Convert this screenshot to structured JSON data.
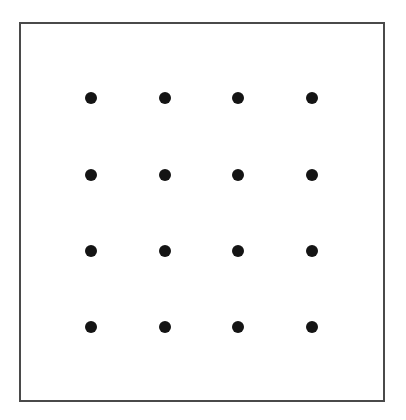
{
  "figure": {
    "title": "",
    "caption": "",
    "background_color": "#ffffff",
    "width": 406,
    "height": 420
  },
  "frame": {
    "name": "outer-border-rectangle",
    "x": 19,
    "y": 22,
    "width": 366,
    "height": 380,
    "border_width": 2,
    "border_color": "#4a4a4a",
    "fill_color": "#ffffff"
  },
  "chart_data": {
    "type": "scatter",
    "title": "",
    "subtitle": "",
    "xlabel": "",
    "ylabel": "",
    "grid": false,
    "legend": null,
    "legend_position": "none",
    "annotations": [],
    "xlim": [
      19,
      385
    ],
    "ylim": [
      22,
      402
    ],
    "xtick_labels": [],
    "ytick_labels": [],
    "marker": {
      "shape": "circle",
      "filled": true,
      "color": "#141414",
      "diameter_px": 12
    },
    "rows": 4,
    "columns": 4,
    "point_count": 16,
    "column_centers_x": [
      91,
      165,
      238,
      312
    ],
    "row_centers_y": [
      98,
      175,
      251,
      327
    ],
    "points": [
      {
        "row": 1,
        "col": 1,
        "x": 91,
        "y": 98
      },
      {
        "row": 1,
        "col": 2,
        "x": 165,
        "y": 98
      },
      {
        "row": 1,
        "col": 3,
        "x": 238,
        "y": 98
      },
      {
        "row": 1,
        "col": 4,
        "x": 312,
        "y": 98
      },
      {
        "row": 2,
        "col": 1,
        "x": 91,
        "y": 175
      },
      {
        "row": 2,
        "col": 2,
        "x": 165,
        "y": 175
      },
      {
        "row": 2,
        "col": 3,
        "x": 238,
        "y": 175
      },
      {
        "row": 2,
        "col": 4,
        "x": 312,
        "y": 175
      },
      {
        "row": 3,
        "col": 1,
        "x": 91,
        "y": 251
      },
      {
        "row": 3,
        "col": 2,
        "x": 165,
        "y": 251
      },
      {
        "row": 3,
        "col": 3,
        "x": 238,
        "y": 251
      },
      {
        "row": 3,
        "col": 4,
        "x": 312,
        "y": 251
      },
      {
        "row": 4,
        "col": 1,
        "x": 91,
        "y": 327
      },
      {
        "row": 4,
        "col": 2,
        "x": 165,
        "y": 327
      },
      {
        "row": 4,
        "col": 3,
        "x": 238,
        "y": 327
      },
      {
        "row": 4,
        "col": 4,
        "x": 312,
        "y": 327
      }
    ]
  }
}
